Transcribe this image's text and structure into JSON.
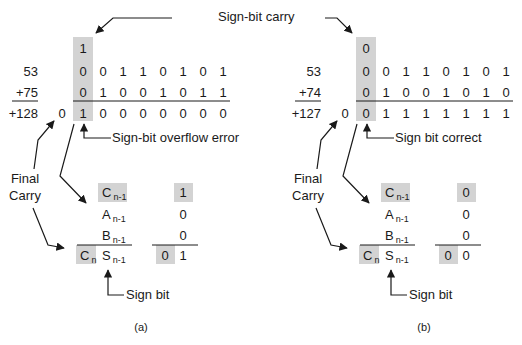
{
  "top_label": "Sign-bit carry",
  "panels": [
    {
      "id": "a",
      "caption": "(a)",
      "operand1_label": "53",
      "operand2_label": "+75",
      "result_label": "+128",
      "carry_bit": "1",
      "operand1_bits": [
        "0",
        "0",
        "1",
        "1",
        "0",
        "1",
        "0",
        "1"
      ],
      "operand2_bits": [
        "0",
        "1",
        "0",
        "0",
        "1",
        "0",
        "1",
        "1"
      ],
      "final_carry": "0",
      "result_bits": [
        "1",
        "0",
        "0",
        "0",
        "0",
        "0",
        "0",
        "0"
      ],
      "sign_note": "Sign-bit overflow error",
      "final_carry_label_line1": "Final",
      "final_carry_label_line2": "Carry",
      "detail": {
        "c_prev_sym": "C",
        "c_prev_sub": "n-1",
        "c_prev_val": "1",
        "a_sym": "A",
        "a_sub": "n-1",
        "a_val": "0",
        "b_sym": "B",
        "b_sub": "n-1",
        "b_val": "0",
        "cn_sym": "C",
        "cn_sub": "n",
        "cn_val": "0",
        "s_sym": "S",
        "s_sub": "n-1",
        "s_val": "1"
      },
      "sign_bit_label": "Sign bit"
    },
    {
      "id": "b",
      "caption": "(b)",
      "operand1_label": "53",
      "operand2_label": "+74",
      "result_label": "+127",
      "carry_bit": "0",
      "operand1_bits": [
        "0",
        "0",
        "1",
        "1",
        "0",
        "1",
        "0",
        "1"
      ],
      "operand2_bits": [
        "0",
        "1",
        "0",
        "0",
        "1",
        "0",
        "1",
        "0"
      ],
      "final_carry": "0",
      "result_bits": [
        "0",
        "1",
        "1",
        "1",
        "1",
        "1",
        "1",
        "1"
      ],
      "sign_note": "Sign bit correct",
      "final_carry_label_line1": "Final",
      "final_carry_label_line2": "Carry",
      "detail": {
        "c_prev_sym": "C",
        "c_prev_sub": "n-1",
        "c_prev_val": "0",
        "a_sym": "A",
        "a_sub": "n-1",
        "a_val": "0",
        "b_sym": "B",
        "b_sub": "n-1",
        "b_val": "0",
        "cn_sym": "C",
        "cn_sub": "n",
        "cn_val": "0",
        "s_sym": "S",
        "s_sub": "n-1",
        "s_val": "0"
      },
      "sign_bit_label": "Sign bit"
    }
  ],
  "colors": {
    "highlight": "#d3d3d3",
    "ink": "#1a1a1a"
  }
}
